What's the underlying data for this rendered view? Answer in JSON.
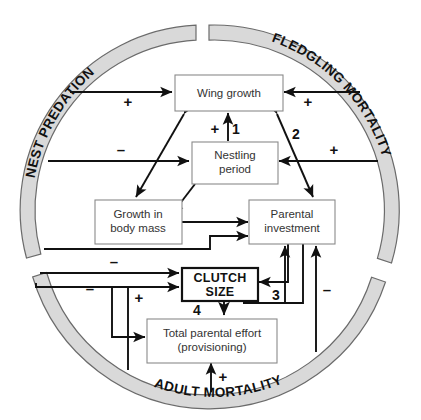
{
  "figure": {
    "type": "conceptual-causal-diagram",
    "ring_labels": {
      "top_left": "NEST PREDATION",
      "top_right": "FLEDGLING MORTALITY",
      "bottom": "ADULT MORTALITY"
    },
    "nodes": {
      "wing_growth": "Wing growth",
      "nestling_period_l1": "Nestling",
      "nestling_period_l2": "period",
      "growth_body_mass_l1": "Growth in",
      "growth_body_mass_l2": "body mass",
      "parental_investment_l1": "Parental",
      "parental_investment_l2": "investment",
      "clutch_size_l1": "CLUTCH",
      "clutch_size_l2": "SIZE",
      "total_parental_effort_l1": "Total parental effort",
      "total_parental_effort_l2": "(provisioning)"
    },
    "signs": {
      "predation_to_wing": "+",
      "fledgling_to_wing": "+",
      "predation_to_nestling": "–",
      "fledgling_to_nestling": "+",
      "nestling_to_wing": "+",
      "predation_to_clutch": "–",
      "predation_to_clutch2": "–",
      "effort_up": "+",
      "adult_to_effort": "+",
      "fledgling_to_parental": "–"
    },
    "numbered_links": {
      "one": "1",
      "two": "2",
      "three": "3",
      "four": "4"
    }
  }
}
